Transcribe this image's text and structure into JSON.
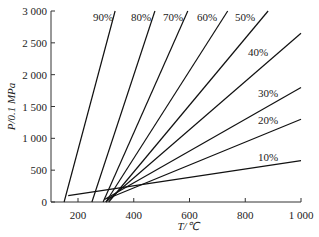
{
  "chart_data": {
    "type": "line",
    "title": "",
    "xlabel": "T/℃",
    "ylabel": "P/0.1 MPa",
    "xlim": [
      130,
      1000
    ],
    "ylim": [
      0,
      3000
    ],
    "xticks": [
      200,
      400,
      600,
      800,
      1000
    ],
    "xtick_labels": [
      "200",
      "400",
      "600",
      "800",
      "1 000"
    ],
    "yticks": [
      0,
      500,
      1000,
      1500,
      2000,
      2500,
      3000
    ],
    "ytick_labels": [
      "0",
      "500",
      "1 000",
      "1 500",
      "2 000",
      "2 500",
      "3 000"
    ],
    "grid": false,
    "legend": "inline labels",
    "series": [
      {
        "name": "90%",
        "x": [
          150,
          333
        ],
        "y": [
          0,
          3000
        ]
      },
      {
        "name": "80%",
        "x": [
          250,
          476
        ],
        "y": [
          0,
          3000
        ]
      },
      {
        "name": "70%",
        "x": [
          290,
          594
        ],
        "y": [
          0,
          3000
        ]
      },
      {
        "name": "60%",
        "x": [
          300,
          737
        ],
        "y": [
          0,
          3000
        ]
      },
      {
        "name": "50%",
        "x": [
          310,
          882
        ],
        "y": [
          0,
          3000
        ]
      },
      {
        "name": "40%",
        "x": [
          300,
          1000
        ],
        "y": [
          0,
          2650
        ]
      },
      {
        "name": "30%",
        "x": [
          295,
          1000
        ],
        "y": [
          40,
          1800
        ]
      },
      {
        "name": "20%",
        "x": [
          305,
          1000
        ],
        "y": [
          50,
          1300
        ]
      },
      {
        "name": "10%",
        "x": [
          165,
          1000
        ],
        "y": [
          100,
          650
        ]
      }
    ]
  }
}
